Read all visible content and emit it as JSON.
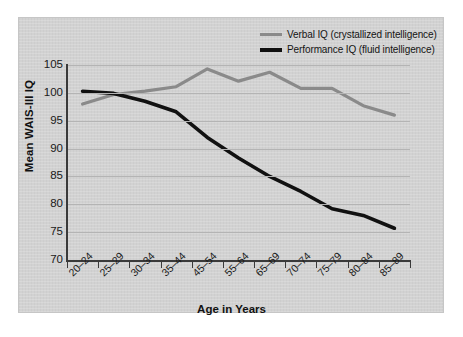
{
  "chart_data": {
    "type": "line",
    "title": "",
    "xlabel": "Age in Years",
    "ylabel": "Mean WAIS-III IQ",
    "categories": [
      "20–24",
      "25–29",
      "30–34",
      "35–44",
      "45–54",
      "55–64",
      "65–69",
      "70–74",
      "75–79",
      "80–84",
      "85–89"
    ],
    "ylim": [
      70,
      105
    ],
    "yticks": [
      70,
      75,
      80,
      85,
      90,
      95,
      100,
      105
    ],
    "ytick_labels": [
      "70",
      "75",
      "80",
      "85",
      "90",
      "95",
      "100",
      "105"
    ],
    "grid": true,
    "legend_position": "top-right",
    "series": [
      {
        "name": "Verbal IQ (crystallized intelligence)",
        "color": "#8a8a8a",
        "values": [
          98.0,
          99.7,
          100.3,
          101.1,
          104.3,
          102.1,
          103.7,
          100.8,
          100.8,
          97.7,
          96.0
        ]
      },
      {
        "name": "Performance IQ (fluid intelligence)",
        "color": "#111111",
        "values": [
          100.3,
          99.9,
          98.5,
          96.6,
          92.0,
          88.3,
          85.0,
          82.3,
          79.2,
          78.0,
          75.7
        ]
      }
    ]
  },
  "legend": {
    "items": [
      {
        "label": "Verbal IQ (crystallized intelligence)"
      },
      {
        "label": "Performance IQ (fluid intelligence)"
      }
    ]
  },
  "colors": {
    "verbal": "#8a8a8a",
    "performance": "#111111",
    "panel": "#d2d2d2",
    "grid": "#b4b4b4",
    "axis": "#3a3a3a"
  }
}
